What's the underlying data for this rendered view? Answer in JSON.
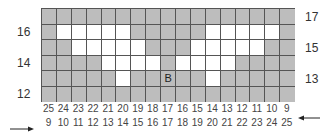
{
  "left_row_labels": [
    {
      "text": "16",
      "top": 25
    },
    {
      "text": "14",
      "top": 56
    },
    {
      "text": "12",
      "top": 87
    }
  ],
  "right_row_labels": [
    {
      "text": "17",
      "top": 10
    },
    {
      "text": "15",
      "top": 41
    },
    {
      "text": "13",
      "top": 72
    }
  ],
  "grid": {
    "rows": 6,
    "cols": 17,
    "colors": {
      "filled": "#bdbdbd",
      "empty": "#ffffff",
      "line": "#555555"
    },
    "white_cells": [
      [],
      [
        1,
        2,
        3,
        4,
        5,
        11,
        12,
        13,
        14,
        15
      ],
      [
        2,
        3,
        4,
        5,
        6,
        10,
        11,
        12,
        13,
        14
      ],
      [
        4,
        5,
        6,
        7,
        9,
        10,
        11,
        12
      ],
      [
        5,
        11
      ],
      []
    ],
    "marker": {
      "row": 4,
      "col": 8,
      "text": "B"
    }
  },
  "axis_top": [
    "25",
    "24",
    "23",
    "22",
    "21",
    "20",
    "19",
    "18",
    "17",
    "16",
    "15",
    "14",
    "13",
    "12",
    "11",
    "10",
    "9"
  ],
  "axis_bottom": [
    "9",
    "10",
    "11",
    "12",
    "13",
    "14",
    "15",
    "16",
    "17",
    "18",
    "19",
    "20",
    "21",
    "22",
    "23",
    "24",
    "25"
  ],
  "arrows": {
    "top_axis": "left-pointing",
    "bottom_axis": "right-pointing"
  }
}
